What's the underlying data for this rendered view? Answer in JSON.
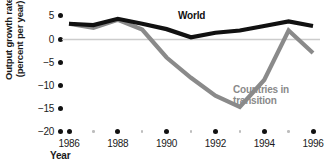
{
  "chart_data": {
    "type": "line",
    "title": "",
    "xlabel": "Year",
    "ylabel": "Output growth rate (percent per year)",
    "ylabel_line1": "Output growth rate",
    "ylabel_line2": "(percent per year)",
    "x": [
      1986,
      1987,
      1988,
      1989,
      1990,
      1991,
      1992,
      1993,
      1994,
      1995,
      1996
    ],
    "categories": [
      "1986",
      "1987",
      "1988",
      "1989",
      "1990",
      "1991",
      "1992",
      "1993",
      "1994",
      "1995",
      "1996"
    ],
    "xtick_labels": [
      "1986",
      "1988",
      "1990",
      "1992",
      "1994",
      "1996"
    ],
    "xtick_values": [
      1986,
      1988,
      1990,
      1992,
      1994,
      1996
    ],
    "minor_xtick_values": [
      1987,
      1989,
      1991,
      1993,
      1995
    ],
    "ytick_labels": [
      "5",
      "0",
      "−5",
      "−10",
      "−15",
      "−20"
    ],
    "ytick_values": [
      5,
      0,
      -5,
      -10,
      -15,
      -20
    ],
    "ylim": [
      -20,
      6
    ],
    "xlim": [
      1985.4,
      1996.6
    ],
    "grid": false,
    "zero_line": true,
    "legend_position": "inline-annotations",
    "series": [
      {
        "name": "World",
        "color": "#111111",
        "values": [
          3.5,
          3.2,
          4.6,
          3.5,
          2.3,
          0.5,
          1.5,
          2.0,
          3.0,
          4.0,
          3.0
        ]
      },
      {
        "name": "Countries in transition",
        "color": "#8a8a8a",
        "values": [
          3.5,
          2.6,
          4.4,
          2.2,
          -4.0,
          -8.5,
          -12.5,
          -15.0,
          -9.0,
          2.0,
          -3.0
        ]
      }
    ],
    "annotations": [
      {
        "text": "World",
        "x": 1991.2,
        "y": 4.2
      },
      {
        "text": "Countries in transition",
        "x": 1993.6,
        "y": -10.5
      }
    ]
  },
  "labels": {
    "world": "World",
    "transition_line1": "Countries in",
    "transition_line2": "transition",
    "x_axis_title": "Year"
  },
  "colors": {
    "world_line": "#111111",
    "transition_line": "#8a8a8a",
    "zero_line": "#cccccc",
    "tick_dot": "#111111",
    "minor_tick_dot": "#bdbdbd",
    "background": "#ffffff"
  }
}
